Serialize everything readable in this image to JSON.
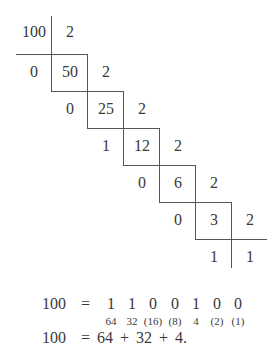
{
  "diagram": {
    "steps": [
      {
        "dividend": "100",
        "divisor": "2",
        "remainder": "0"
      },
      {
        "dividend": "50",
        "divisor": "2",
        "remainder": "0"
      },
      {
        "dividend": "25",
        "divisor": "2",
        "remainder": "1"
      },
      {
        "dividend": "12",
        "divisor": "2",
        "remainder": "0"
      },
      {
        "dividend": "6",
        "divisor": "2",
        "remainder": "0"
      },
      {
        "dividend": "3",
        "divisor": "2",
        "remainder": "1"
      },
      {
        "dividend": "1",
        "divisor": "",
        "remainder": "1"
      }
    ],
    "row0_left": "100",
    "row0_right": "2",
    "row1": [
      "0",
      "50",
      "2"
    ],
    "row2": [
      "0",
      "25",
      "2"
    ],
    "row3": [
      "1",
      "12",
      "2"
    ],
    "row4": [
      "0",
      "6",
      "2"
    ],
    "row5": [
      "0",
      "3",
      "2"
    ],
    "row6": [
      "1",
      "1"
    ]
  },
  "result": {
    "line1_lhs": "100",
    "line1_eq": "=",
    "bits": [
      "1",
      "1",
      "0",
      "0",
      "1",
      "0",
      "0"
    ],
    "weights": [
      "64",
      "32",
      "(16)",
      "(8)",
      "4",
      "(2)",
      "(1)"
    ],
    "line2_lhs": "100",
    "line2_eq": "=",
    "line2_rhs": "64 + 32 + 4."
  }
}
